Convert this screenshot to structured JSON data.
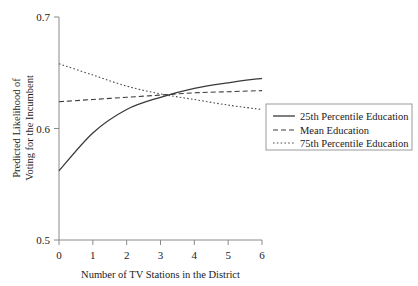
{
  "chart_data": {
    "type": "line",
    "title": "",
    "subtitle": "",
    "xlabel": "Number of TV Stations in the District",
    "ylabel": "Predicted Likelihood of Voting for the Incumbent",
    "ylabel_line1": "Predicted Likelihood of",
    "ylabel_line2": "Voting for the Incumbent",
    "x": [
      0,
      1,
      2,
      3,
      4,
      5,
      6
    ],
    "xlim": [
      0,
      6
    ],
    "ylim": [
      0.5,
      0.7
    ],
    "xticks": [
      "0",
      "1",
      "2",
      "3",
      "4",
      "5",
      "6"
    ],
    "yticks": [
      "0.5",
      "0.6",
      "0.7"
    ],
    "ytick_values": [
      0.5,
      0.6,
      0.7
    ],
    "grid": false,
    "legend_position": "right",
    "series": [
      {
        "name": "25th Percentile Education",
        "style": "solid",
        "values": [
          0.562,
          0.596,
          0.617,
          0.628,
          0.636,
          0.641,
          0.645
        ]
      },
      {
        "name": "Mean Education",
        "style": "dashed",
        "values": [
          0.624,
          0.626,
          0.628,
          0.63,
          0.632,
          0.633,
          0.634
        ]
      },
      {
        "name": "75th Percentile Education",
        "style": "dotted",
        "values": [
          0.658,
          0.648,
          0.638,
          0.631,
          0.626,
          0.621,
          0.617
        ]
      }
    ]
  },
  "legend": {
    "entries": [
      {
        "label": "25th Percentile Education"
      },
      {
        "label": "Mean Education"
      },
      {
        "label": "75th Percentile Education"
      }
    ]
  },
  "axes": {
    "x_title": "Number of TV Stations in the District",
    "y_title_line1": "Predicted Likelihood of",
    "y_title_line2": "Voting for the Incumbent",
    "x_tick_labels": [
      "0",
      "1",
      "2",
      "3",
      "4",
      "5",
      "6"
    ],
    "y_tick_labels": [
      "0.7",
      "0.6",
      "0.5"
    ]
  },
  "colors": {
    "line": "#3a3a3a",
    "axis": "#8a8a8a",
    "text": "#1a1a1a",
    "background": "#ffffff"
  }
}
